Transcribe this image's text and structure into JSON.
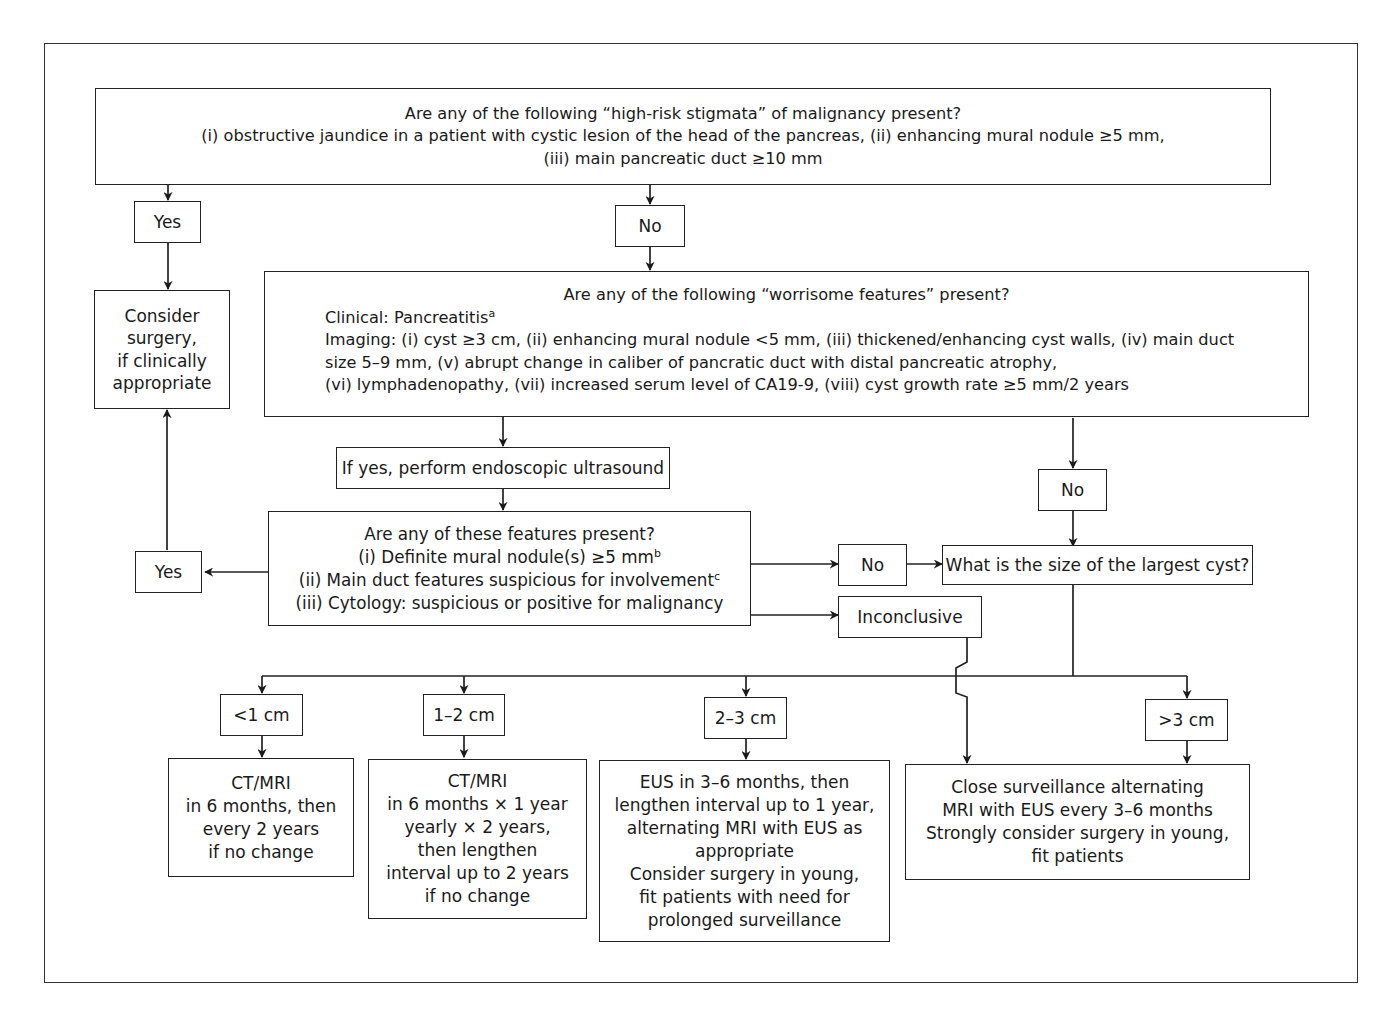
{
  "diagram": {
    "high_risk": {
      "title": "Are any of the following “high-risk stigmata” of malignancy present?",
      "lines": [
        "(i) obstructive jaundice in a patient with cystic lesion of the head of the pancreas, (ii) enhancing mural nodule ≥5 mm,",
        "(iii) main pancreatic duct ≥10 mm"
      ]
    },
    "high_risk_yes": "Yes",
    "high_risk_no": "No",
    "consider_surgery": [
      "Consider",
      "surgery,",
      "if clinically",
      "appropriate"
    ],
    "worrisome": {
      "title": "Are any of the following “worrisome features” present?",
      "clinical": "Clinical: Pancreatitis",
      "clinical_sup": "a",
      "imaging_lines": [
        "Imaging: (i) cyst ≥3 cm, (ii) enhancing mural nodule <5 mm, (iii) thickened/enhancing cyst walls, (iv) main duct",
        "size 5–9 mm, (v) abrupt change in caliber of pancratic duct with distal pancreatic atrophy,",
        "(vi) lymphadenopathy, (vii) increased serum level of CA19-9, (viii) cyst growth rate ≥5 mm/2 years"
      ]
    },
    "eus_step": "If yes, perform endoscopic ultrasound",
    "worrisome_no": "No",
    "eus_features": {
      "title": "Are any of these features present?",
      "item1": "(i) Definite mural nodule(s) ≥5 mm",
      "item1_sup": "b",
      "item2": "(ii) Main duct features suspicious for involvement",
      "item2_sup": "c",
      "item3": "(iii) Cytology: suspicious or positive for malignancy"
    },
    "eus_yes": "Yes",
    "eus_no": "No",
    "eus_inconclusive": "Inconclusive",
    "cyst_size_question": "What is the size of the largest cyst?",
    "size_categories": [
      {
        "label": "<1 cm",
        "action": [
          "CT/MRI",
          "in 6 months, then",
          "every 2 years",
          "if no change"
        ]
      },
      {
        "label": "1–2 cm",
        "action": [
          "CT/MRI",
          "in 6 months × 1 year",
          "yearly × 2 years,",
          "then lengthen",
          "interval up to 2 years",
          "if no change"
        ]
      },
      {
        "label": "2–3 cm",
        "action": [
          "EUS in 3–6 months, then",
          "lengthen interval up to 1 year,",
          "alternating MRI with EUS as",
          "appropriate",
          "Consider surgery in young,",
          "fit patients with need for",
          "prolonged surveillance"
        ]
      },
      {
        "label": ">3 cm",
        "action": [
          "Close surveillance alternating",
          "MRI with EUS every 3–6 months",
          "Strongly consider surgery in young,",
          "fit patients"
        ]
      }
    ]
  },
  "colors": {
    "line": "#222222",
    "background": "#ffffff",
    "text": "#1a1a1a"
  }
}
